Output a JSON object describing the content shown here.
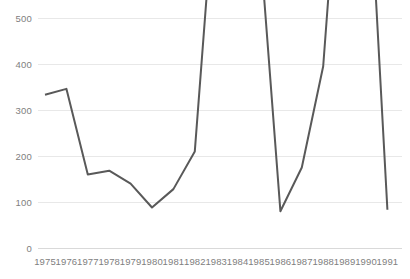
{
  "chart_data": {
    "type": "line",
    "title": "",
    "subtitle": "",
    "xlabel": "",
    "ylabel": "",
    "categories": [
      "1975",
      "1976",
      "1977",
      "1978",
      "1979",
      "1980",
      "1981",
      "1982",
      "1983",
      "1984",
      "1985",
      "1986",
      "1987",
      "1988",
      "1989",
      "1990",
      "1991"
    ],
    "series": [
      {
        "name": "series-1",
        "color": "#595959",
        "values": [
          333,
          346,
          160,
          168,
          140,
          88,
          128,
          210,
          820,
          1150,
          690,
          80,
          175,
          395,
          1020,
          940,
          83
        ]
      }
    ],
    "ylim": [
      0,
      500
    ],
    "yticks": [
      0,
      100,
      200,
      300,
      400,
      500
    ],
    "ytick_labels": [
      "0",
      "100",
      "200",
      "300",
      "400",
      "500"
    ],
    "grid": true,
    "grid_axis": "y",
    "legend": false,
    "legend_position": "none",
    "clipped_above_axis_max": true,
    "annotations": [
      "Line exceeds the 500 y-axis maximum between 1983 and 1985 and again between 1988 and 1990, so those segments are clipped at the top of the plot."
    ]
  },
  "style": {
    "background": "#ffffff",
    "line_color": "#595959",
    "gridline_color": "#e8e8e8",
    "axis_text_color": "#808080",
    "line_width": 2
  }
}
